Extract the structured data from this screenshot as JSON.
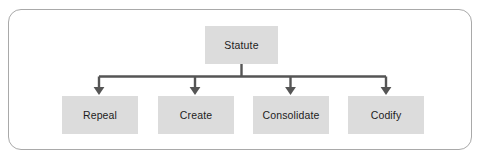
{
  "diagram": {
    "type": "tree",
    "orientation": "top-down",
    "title": "Statute",
    "root": {
      "id": "root",
      "label": "Statute"
    },
    "children": [
      {
        "id": "child-0",
        "label": "Repeal"
      },
      {
        "id": "child-1",
        "label": "Create"
      },
      {
        "id": "child-2",
        "label": "Consolidate"
      },
      {
        "id": "child-3",
        "label": "Codify"
      }
    ],
    "connector": {
      "style": "orthogonal-bus",
      "arrowhead": "filled-triangle-down",
      "count": 4
    },
    "colors": {
      "node_fill": "#dcdcdc",
      "node_text": "#1d1d1d",
      "connector": "#555555",
      "frame_border": "#a9a9a9",
      "background": "#ffffff"
    }
  }
}
